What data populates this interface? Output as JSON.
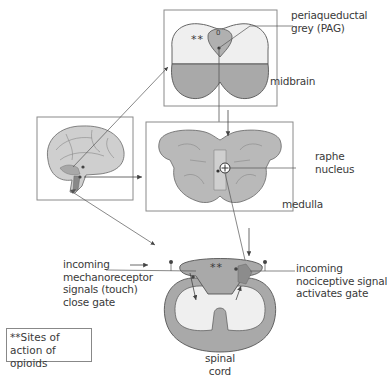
{
  "labels": {
    "pag": [
      "periaqueductal",
      "grey (PAG)"
    ],
    "midbrain": "midbrain",
    "raphe": [
      "raphe",
      "nucleus"
    ],
    "medulla": "medulla",
    "mechano": [
      "incoming",
      "mechanoreceptor",
      "signals (touch)",
      "close gate"
    ],
    "nociceptive": [
      "incoming",
      "nociceptive signal",
      "activates gate"
    ],
    "spinal": [
      "spinal",
      "cord"
    ],
    "pag_mark": "0",
    "opioid_mark_midbrain": "**",
    "opioid_mark_spinal": "**"
  },
  "legend": {
    "text": "**Sites of action of opioids"
  },
  "colors": {
    "tissue_light": "#efefef",
    "tissue_mid": "#b4b4b4",
    "tissue_dark": "#9e9e9e",
    "line": "#555555",
    "box_border": "#8a8a8a"
  }
}
